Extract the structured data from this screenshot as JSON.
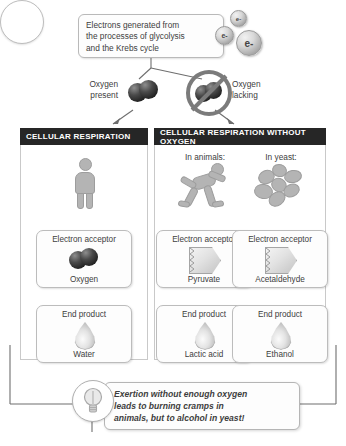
{
  "diagram": {
    "intro": {
      "text": "Electrons generated from\nthe processes of glycolysis\nand the Krebs cycle",
      "electrons": [
        {
          "label": "e-"
        },
        {
          "label": "e-"
        },
        {
          "label": "e-"
        }
      ]
    },
    "branches": {
      "present_label": "Oxygen\npresent",
      "lacking_label": "Oxygen\nlacking"
    },
    "panels": [
      {
        "header": "CELLULAR RESPIRATION",
        "subheads": [],
        "columns": [
          {
            "organism_icon": "standing-person-icon",
            "acceptor_caption": "Electron acceptor",
            "acceptor_name": "Oxygen",
            "acceptor_icon": "oxygen-molecule-icon",
            "product_caption": "End product",
            "product_name": "Water",
            "product_icon": "droplet-icon"
          }
        ]
      },
      {
        "header": "CELLULAR RESPIRATION WITHOUT OXYGEN",
        "subheads": [
          "In animals:",
          "In yeast:"
        ],
        "columns": [
          {
            "organism_icon": "running-person-icon",
            "acceptor_caption": "Electron acceptor",
            "acceptor_name": "Pyruvate",
            "acceptor_icon": "pentagon-molecule-icon",
            "product_caption": "End product",
            "product_name": "Lactic acid",
            "product_icon": "droplet-icon"
          },
          {
            "organism_icon": "yeast-cells-icon",
            "acceptor_caption": "Electron acceptor",
            "acceptor_name": "Acetaldehyde",
            "acceptor_icon": "pentagon-molecule-icon",
            "product_caption": "End product",
            "product_name": "Ethanol",
            "product_icon": "droplet-icon"
          }
        ]
      }
    ],
    "caption": {
      "icon": "lightbulb-icon",
      "text": "Exertion without enough oxygen\nleads to burning cramps in\nanimals, but to alcohol in yeast!"
    },
    "colors": {
      "header_bar": "#262626",
      "header_text": "#ffffff",
      "box_border": "#bcbcbc",
      "body_text": "#404040",
      "connector": "#6e6e6e",
      "icon_gray": "#b4b4b4",
      "oxygen_dark": "#1d1d1d"
    }
  }
}
